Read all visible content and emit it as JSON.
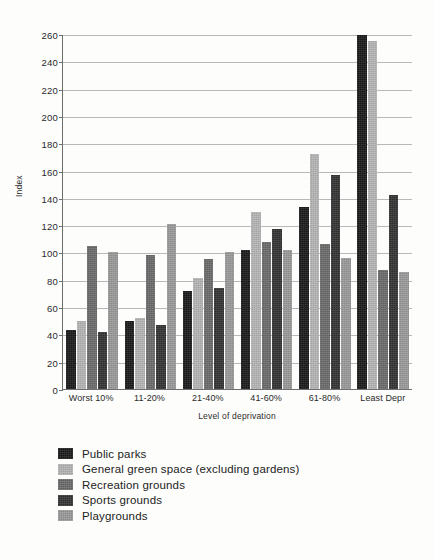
{
  "chart_data": {
    "type": "bar",
    "title": "",
    "subtitle": "",
    "xlabel": "Level of deprivation",
    "ylabel": "Index",
    "ylim": [
      0,
      260
    ],
    "ytick_step": 20,
    "yticks": [
      260,
      240,
      220,
      200,
      180,
      160,
      140,
      120,
      100,
      80,
      60,
      40,
      20,
      0
    ],
    "grid": true,
    "grid_axis": "y",
    "legend_position": "below-left",
    "categories": [
      "Worst 10%",
      "11-20%",
      "21-40%",
      "41-60%",
      "61-80%",
      "Least Depr"
    ],
    "series": [
      {
        "name": "Public parks",
        "color": "#1a1a1a",
        "values": [
          43,
          50,
          72,
          102,
          133,
          259
        ]
      },
      {
        "name": "General green space (excluding gardens)",
        "color": "#b5b5b5",
        "values": [
          50,
          52,
          81,
          130,
          172,
          255
        ]
      },
      {
        "name": "Recreation grounds",
        "color": "#6b6b6b",
        "values": [
          105,
          98,
          95,
          108,
          106,
          87
        ]
      },
      {
        "name": "Sports grounds",
        "color": "#333333",
        "values": [
          42,
          47,
          74,
          117,
          157,
          142
        ]
      },
      {
        "name": "Playgrounds",
        "color": "#9a9a9a",
        "values": [
          100,
          121,
          100,
          102,
          96,
          86
        ]
      }
    ]
  },
  "legend": {
    "items": [
      {
        "label": "Public parks",
        "color": "#1a1a1a"
      },
      {
        "label": "General green space (excluding gardens)",
        "color": "#b5b5b5"
      },
      {
        "label": "Recreation grounds",
        "color": "#6b6b6b"
      },
      {
        "label": "Sports grounds",
        "color": "#333333"
      },
      {
        "label": "Playgrounds",
        "color": "#9a9a9a"
      }
    ]
  }
}
